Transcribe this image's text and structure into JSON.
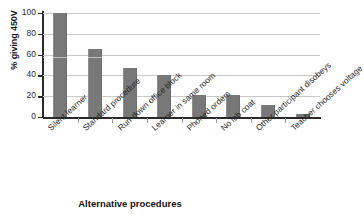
{
  "chart_data": {
    "type": "bar",
    "title": "",
    "xlabel": "Alternative procedures",
    "ylabel": "% giving 450V",
    "ylim": [
      0,
      100
    ],
    "yticks": [
      0,
      20,
      40,
      60,
      80,
      100
    ],
    "grid": true,
    "legend": "none",
    "bar_color": "#787878",
    "categories": [
      "Silent learner",
      "Standard procedure",
      "Run-down office block",
      "Learner in same room",
      "Phoned orders",
      "No lab coat",
      "Other participant disobeys",
      "Teacher chooses voltage"
    ],
    "values": [
      100,
      65,
      47.5,
      40.5,
      21,
      21,
      11.5,
      3
    ]
  },
  "axes": {
    "y": {
      "label": "% giving 450V",
      "ticks": [
        "0",
        "20",
        "40",
        "60",
        "80",
        "100"
      ]
    },
    "x": {
      "label": "Alternative procedures"
    }
  }
}
